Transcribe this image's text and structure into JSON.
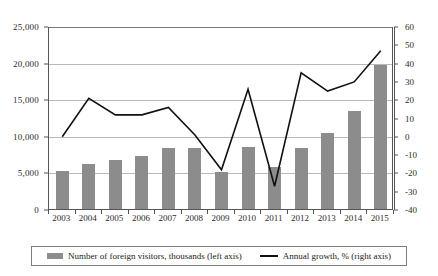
{
  "chart_data": {
    "type": "bar",
    "title": "",
    "subtitle": "",
    "xlabel": "",
    "ylabel": "",
    "grid": true,
    "legend_position": "bottom",
    "categories": [
      "2003",
      "2004",
      "2005",
      "2006",
      "2007",
      "2008",
      "2009",
      "2010",
      "2011",
      "2012",
      "2013",
      "2014",
      "2015"
    ],
    "series": [
      {
        "name": "Number of foreign visitors, thousands (left axis)",
        "type": "bar",
        "axis": "left",
        "color": "#8c8c8c",
        "values": [
          5200,
          6100,
          6700,
          7300,
          8400,
          8400,
          5100,
          8500,
          5700,
          8400,
          10400,
          13400,
          19700
        ]
      },
      {
        "name": "Annual growth, % (right axis)",
        "type": "line",
        "axis": "right",
        "color": "#111111",
        "values": [
          0,
          21,
          12,
          12,
          16,
          1,
          -18,
          26,
          -27,
          35,
          25,
          30,
          47
        ]
      }
    ],
    "left_axis": {
      "label": "Number of foreign visitors, thousands",
      "ticks": [
        "0",
        "5,000",
        "10,000",
        "15,000",
        "20,000",
        "25,000"
      ],
      "tick_values": [
        0,
        5000,
        10000,
        15000,
        20000,
        25000
      ],
      "ylim": [
        0,
        25000
      ]
    },
    "right_axis": {
      "label": "Annual growth, %",
      "ticks": [
        "-40",
        "-30",
        "-20",
        "-10",
        "0",
        "10",
        "20",
        "30",
        "40",
        "50",
        "60"
      ],
      "tick_values": [
        -40,
        -30,
        -20,
        -10,
        0,
        10,
        20,
        30,
        40,
        50,
        60
      ],
      "ylim": [
        -40,
        60
      ]
    },
    "legend": [
      {
        "label": "Number of foreign visitors, thousands (left axis)",
        "marker": "bar-swatch",
        "color": "#8c8c8c"
      },
      {
        "label": "Annual growth, % (right axis)",
        "marker": "line-swatch",
        "color": "#111111"
      }
    ]
  }
}
